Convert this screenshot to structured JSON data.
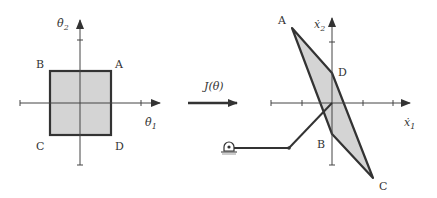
{
  "left_panel": {
    "axis_x_label": "θ̇",
    "axis_x_sub": "1",
    "axis_y_label": "θ̇",
    "axis_y_sub": "2",
    "corners": {
      "A": "A",
      "B": "B",
      "C": "C",
      "D": "D"
    },
    "fill_color": "#d4d4d4",
    "stroke_color": "#333333"
  },
  "mapping": {
    "label": "J(θ)"
  },
  "right_panel": {
    "axis_x_label": "ẋ",
    "axis_x_sub": "1",
    "axis_y_label": "ẋ",
    "axis_y_sub": "2",
    "corners": {
      "A": "A",
      "B": "B",
      "C": "C",
      "D": "D"
    },
    "fill_color": "#d4d4d4",
    "stroke_color": "#333333"
  },
  "robot_arm": {
    "description": "two-link planar arm with ground pivot"
  }
}
